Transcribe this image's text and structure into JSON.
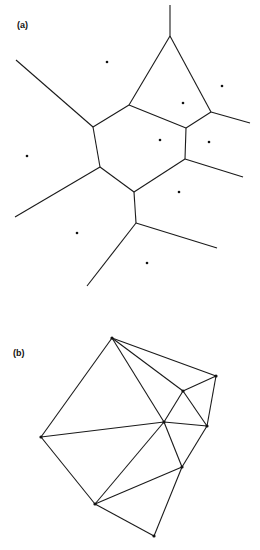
{
  "panels": [
    {
      "label": "(a)",
      "label_pos": [
        17,
        20
      ],
      "type": "voronoi",
      "edges": [
        [
          [
            170,
            5
          ],
          [
            170,
            36
          ]
        ],
        [
          [
            170,
            36
          ],
          [
            129,
            105
          ]
        ],
        [
          [
            170,
            36
          ],
          [
            211,
            112
          ]
        ],
        [
          [
            129,
            105
          ],
          [
            186,
            128
          ]
        ],
        [
          [
            211,
            112
          ],
          [
            186,
            128
          ]
        ],
        [
          [
            211,
            112
          ],
          [
            250,
            123
          ]
        ],
        [
          [
            16,
            60
          ],
          [
            93,
            127
          ]
        ],
        [
          [
            93,
            127
          ],
          [
            129,
            105
          ]
        ],
        [
          [
            93,
            127
          ],
          [
            100,
            167
          ]
        ],
        [
          [
            186,
            128
          ],
          [
            185,
            159
          ]
        ],
        [
          [
            185,
            159
          ],
          [
            243,
            177
          ]
        ],
        [
          [
            185,
            159
          ],
          [
            134,
            192
          ]
        ],
        [
          [
            100,
            167
          ],
          [
            15,
            217
          ]
        ],
        [
          [
            100,
            167
          ],
          [
            134,
            192
          ]
        ],
        [
          [
            134,
            192
          ],
          [
            136,
            223
          ]
        ],
        [
          [
            136,
            223
          ],
          [
            217,
            248
          ]
        ],
        [
          [
            136,
            223
          ],
          [
            87,
            286
          ]
        ]
      ],
      "sites": [
        [
          107,
          62
        ],
        [
          222,
          86
        ],
        [
          183,
          103
        ],
        [
          160,
          140
        ],
        [
          209,
          142
        ],
        [
          27,
          156
        ],
        [
          179,
          192
        ],
        [
          77,
          233
        ],
        [
          147,
          263
        ]
      ]
    },
    {
      "label": "(b)",
      "label_pos": [
        13,
        348
      ],
      "type": "delaunay",
      "points": {
        "P1": [
          112,
          338
        ],
        "P2": [
          216,
          376
        ],
        "P3": [
          183,
          391
        ],
        "P4": [
          164,
          422
        ],
        "P5": [
          207,
          426
        ],
        "P6": [
          41,
          437
        ],
        "P7": [
          182,
          467
        ],
        "P8": [
          95,
          504
        ],
        "P9": [
          154,
          536
        ]
      },
      "edges": [
        [
          "P1",
          "P6"
        ],
        [
          "P1",
          "P4"
        ],
        [
          "P1",
          "P3"
        ],
        [
          "P1",
          "P2"
        ],
        [
          "P2",
          "P3"
        ],
        [
          "P2",
          "P5"
        ],
        [
          "P3",
          "P4"
        ],
        [
          "P3",
          "P5"
        ],
        [
          "P6",
          "P4"
        ],
        [
          "P6",
          "P8"
        ],
        [
          "P4",
          "P5"
        ],
        [
          "P4",
          "P8"
        ],
        [
          "P4",
          "P7"
        ],
        [
          "P5",
          "P7"
        ],
        [
          "P7",
          "P8"
        ],
        [
          "P7",
          "P9"
        ],
        [
          "P8",
          "P9"
        ]
      ]
    }
  ],
  "style": {
    "line_color": "#1a1a1a",
    "dot_color": "#111111",
    "background": "#ffffff"
  }
}
